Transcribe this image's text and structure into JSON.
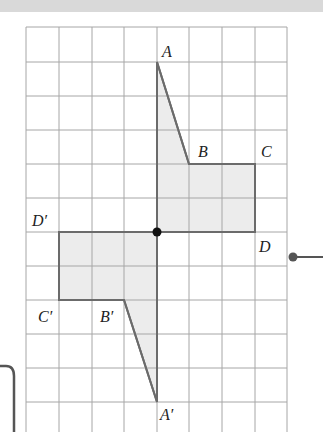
{
  "diagram": {
    "grid": {
      "columns": 8,
      "rows": 12,
      "line_color": "#9e9e9e"
    },
    "colors": {
      "fill": "#ececec",
      "outline": "#6b6b6b",
      "center_point": "#111111",
      "top_band": "#d9d9d9"
    },
    "shape_original": {
      "vertices": [
        "A",
        "B",
        "C",
        "D"
      ]
    },
    "shape_image": {
      "vertices": [
        "A'",
        "B'",
        "C'",
        "D'"
      ]
    },
    "labels": {
      "A": "A",
      "B": "B",
      "C": "C",
      "D": "D",
      "A_prime": "A′",
      "B_prime": "B′",
      "C_prime": "C′",
      "D_prime": "D′"
    }
  }
}
